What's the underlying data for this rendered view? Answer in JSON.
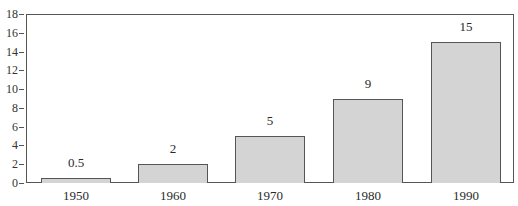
{
  "chart_data": {
    "type": "bar",
    "title": "",
    "xlabel": "",
    "ylabel": "",
    "categories": [
      "1950",
      "1960",
      "1970",
      "1980",
      "1990"
    ],
    "values": [
      0.5,
      2,
      5,
      9,
      15
    ],
    "value_labels": [
      "0.5",
      "2",
      "5",
      "9",
      "15"
    ],
    "ylim": [
      0,
      18
    ],
    "yticks": [
      0,
      2,
      4,
      6,
      8,
      10,
      12,
      14,
      16,
      18
    ],
    "ytick_labels": [
      "0",
      "2",
      "4",
      "6",
      "8",
      "10",
      "12",
      "14",
      "16",
      "18"
    ],
    "grid": false,
    "legend": null,
    "bar_color": "#d4d4d4",
    "edge_color": "#555555"
  }
}
